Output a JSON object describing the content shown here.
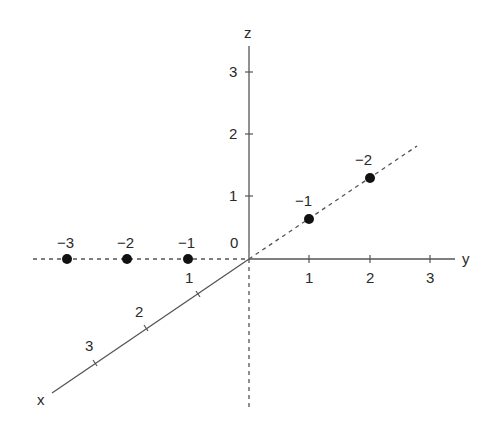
{
  "diagram": {
    "type": "3d-axes",
    "axes": {
      "x": {
        "label": "x",
        "ticks": [
          "1",
          "2",
          "3"
        ]
      },
      "y": {
        "label": "y",
        "ticks": [
          "1",
          "2",
          "3"
        ]
      },
      "z": {
        "label": "z",
        "ticks": [
          "1",
          "2",
          "3"
        ]
      },
      "origin_label": "0"
    },
    "points_left": [
      {
        "label": "−3"
      },
      {
        "label": "−2"
      },
      {
        "label": "−1"
      }
    ],
    "points_diagonal": [
      {
        "label": "−1"
      },
      {
        "label": "−2"
      }
    ],
    "colors": {
      "axis": "#555555",
      "point": "#111111",
      "text": "#2a2a2a"
    }
  }
}
